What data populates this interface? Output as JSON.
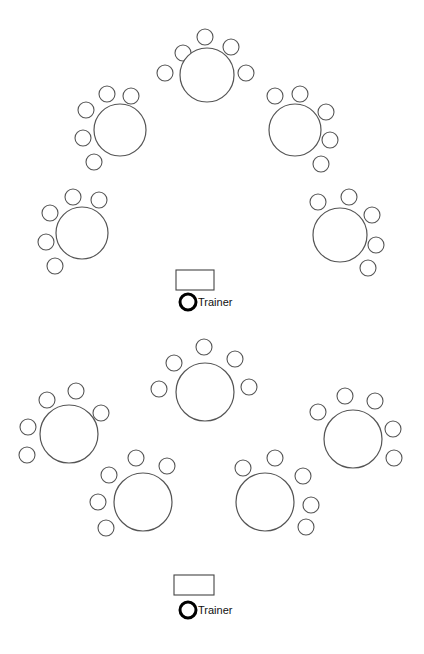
{
  "diagram": {
    "title": "",
    "layouts": [
      {
        "name": "crescent-arc-layout",
        "tables": [
          {
            "cx": 207,
            "cy": 75,
            "r": 27,
            "chairs": [
              [
                165,
                73
              ],
              [
                183,
                53
              ],
              [
                205,
                37
              ],
              [
                231,
                47
              ],
              [
                246,
                73
              ]
            ]
          },
          {
            "cx": 120,
            "cy": 130,
            "r": 26,
            "chairs": [
              [
                86,
                110
              ],
              [
                107,
                94
              ],
              [
                131,
                96
              ],
              [
                83,
                138
              ],
              [
                94,
                162
              ]
            ]
          },
          {
            "cx": 295,
            "cy": 130,
            "r": 26,
            "chairs": [
              [
                275,
                96
              ],
              [
                300,
                94
              ],
              [
                326,
                112
              ],
              [
                330,
                140
              ],
              [
                321,
                164
              ]
            ]
          },
          {
            "cx": 82,
            "cy": 233,
            "r": 26,
            "chairs": [
              [
                50,
                213
              ],
              [
                73,
                197
              ],
              [
                99,
                200
              ],
              [
                46,
                242
              ],
              [
                55,
                266
              ]
            ]
          },
          {
            "cx": 340,
            "cy": 235,
            "r": 27,
            "chairs": [
              [
                318,
                202
              ],
              [
                349,
                197
              ],
              [
                372,
                215
              ],
              [
                376,
                245
              ],
              [
                368,
                268
              ]
            ]
          }
        ],
        "podium": {
          "x": 176,
          "y": 270,
          "w": 38,
          "h": 20
        },
        "trainer": {
          "cx": 188,
          "cy": 302,
          "r": 8,
          "label": "Trainer"
        }
      },
      {
        "name": "cabaret-layout",
        "tables": [
          {
            "cx": 205,
            "cy": 392,
            "r": 29,
            "chairs": [
              [
                159,
                389
              ],
              [
                174,
                363
              ],
              [
                204,
                347
              ],
              [
                235,
                359
              ],
              [
                249,
                387
              ]
            ]
          },
          {
            "cx": 69,
            "cy": 434,
            "r": 29,
            "chairs": [
              [
                28,
                427
              ],
              [
                47,
                400
              ],
              [
                76,
                391
              ],
              [
                101,
                413
              ],
              [
                27,
                455
              ]
            ]
          },
          {
            "cx": 353,
            "cy": 439,
            "r": 29,
            "chairs": [
              [
                318,
                412
              ],
              [
                345,
                396
              ],
              [
                375,
                401
              ],
              [
                393,
                429
              ],
              [
                394,
                458
              ]
            ]
          },
          {
            "cx": 143,
            "cy": 502,
            "r": 29,
            "chairs": [
              [
                109,
                475
              ],
              [
                136,
                458
              ],
              [
                167,
                466
              ],
              [
                98,
                502
              ],
              [
                106,
                528
              ]
            ]
          },
          {
            "cx": 265,
            "cy": 502,
            "r": 29,
            "chairs": [
              [
                243,
                468
              ],
              [
                275,
                458
              ],
              [
                303,
                476
              ],
              [
                311,
                505
              ],
              [
                306,
                527
              ]
            ]
          }
        ],
        "podium": {
          "x": 174,
          "y": 575,
          "w": 40,
          "h": 20
        },
        "trainer": {
          "cx": 188,
          "cy": 610,
          "r": 8,
          "label": "Trainer"
        }
      }
    ],
    "chair_radius": 8,
    "colors": {
      "stroke": "#555555",
      "trainer": "#000000",
      "background": "#ffffff"
    }
  }
}
